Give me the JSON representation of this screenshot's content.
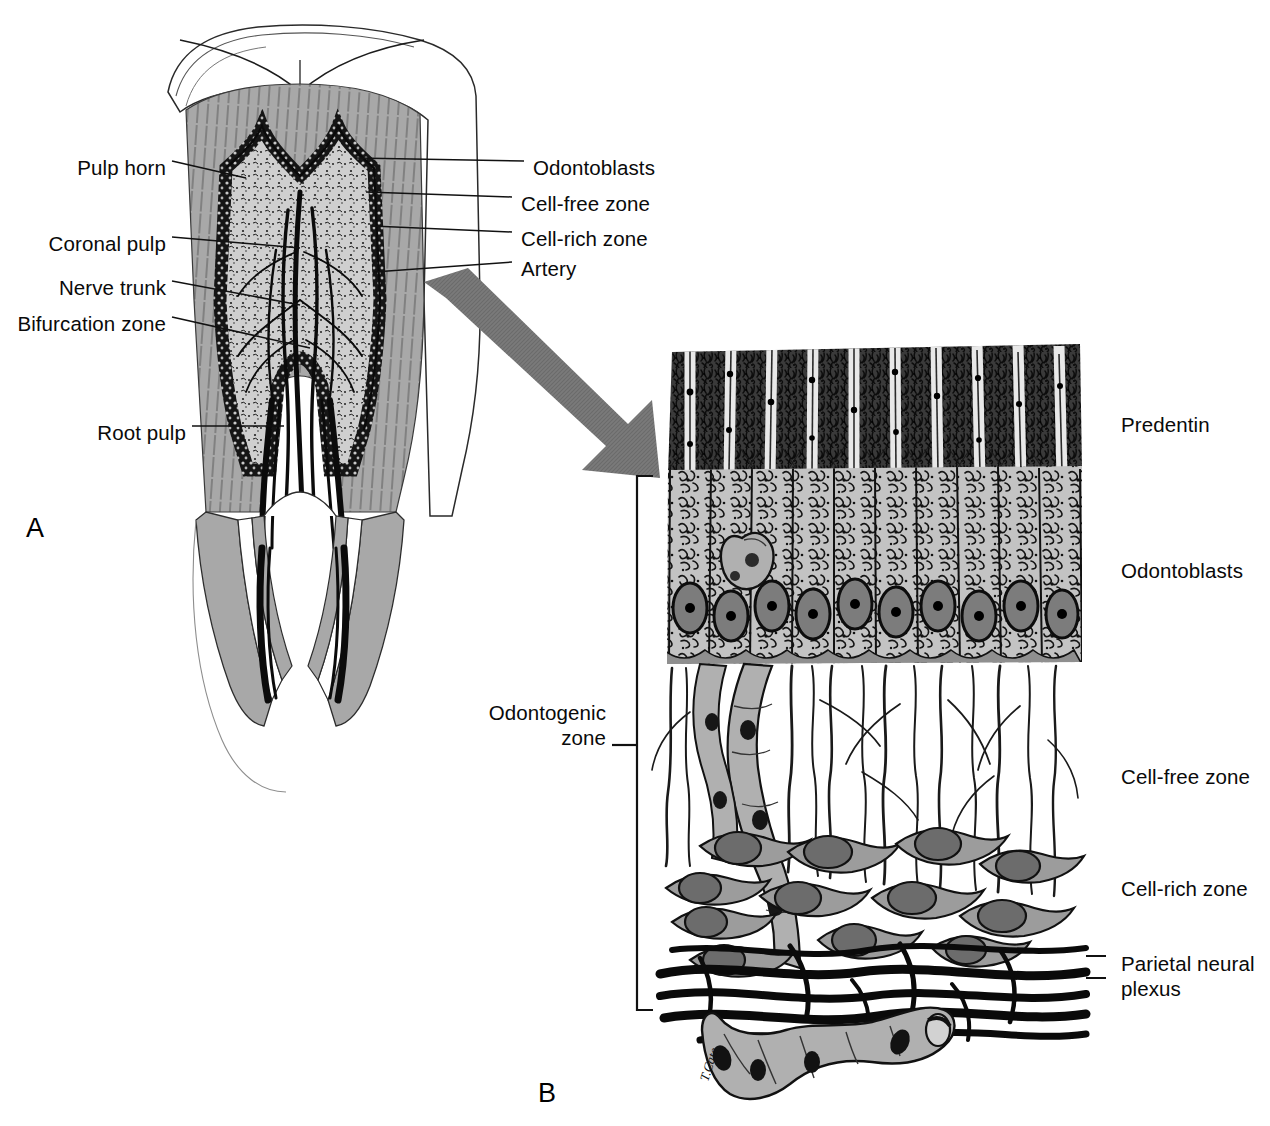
{
  "figure": {
    "panels": [
      {
        "id": "A",
        "letter": "A",
        "caption": "Sectioned molar showing pulp anatomy"
      },
      {
        "id": "B",
        "letter": "B",
        "caption": "High magnification of the odontogenic zone"
      }
    ]
  },
  "panelA": {
    "letter": "A",
    "labels_left": [
      {
        "text": "Pulp horn",
        "x": 166,
        "y": 167
      },
      {
        "text": "Coronal pulp",
        "x": 166,
        "y": 243
      },
      {
        "text": "Nerve trunk",
        "x": 166,
        "y": 287
      },
      {
        "text": "Bifurcation zone",
        "x": 166,
        "y": 323
      },
      {
        "text": "Root pulp",
        "x": 186,
        "y": 432
      }
    ],
    "labels_right": [
      {
        "text": "Odontoblasts",
        "x": 533,
        "y": 167
      },
      {
        "text": "Cell-free zone",
        "x": 521,
        "y": 203
      },
      {
        "text": "Cell-rich zone",
        "x": 521,
        "y": 238
      },
      {
        "text": "Artery",
        "x": 521,
        "y": 268
      }
    ]
  },
  "panelB": {
    "letter": "B",
    "bracket_label": "Odontogenic\nzone",
    "bracket_label_line1": "Odontogenic",
    "bracket_label_line2": "zone",
    "labels_right": [
      {
        "text": "Predentin",
        "y": 424
      },
      {
        "text": "Odontoblasts",
        "y": 570
      },
      {
        "text": "Cell-free zone",
        "y": 776
      },
      {
        "text": "Cell-rich zone",
        "y": 888
      },
      {
        "text": "Parietal neural",
        "y": 963
      },
      {
        "text": "plexus",
        "y": 988
      }
    ],
    "zones": [
      {
        "name": "predentin",
        "label": "Predentin"
      },
      {
        "name": "odontoblasts",
        "label": "Odontoblasts"
      },
      {
        "name": "cell-free-zone",
        "label": "Cell-free zone"
      },
      {
        "name": "cell-rich-zone",
        "label": "Cell-rich zone"
      },
      {
        "name": "parietal-neural-plexus",
        "label": "Parietal neural plexus"
      }
    ]
  },
  "colors": {
    "ink": "#0a0a0a",
    "dentin_gray": "#a8a8a8",
    "pulp_gray": "#9a9a9a",
    "cell_gray": "#bdbdbd",
    "nucleus_gray": "#7e7e7e",
    "arrow_gray": "#767676",
    "background": "#ffffff"
  }
}
